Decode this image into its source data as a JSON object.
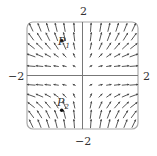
{
  "diagram": {
    "type": "vector_field",
    "field": "F(x,y) = <x, y^2> (sketch)",
    "x_range": [
      -2,
      2
    ],
    "y_range": [
      -2,
      2
    ],
    "labels": {
      "top": "2",
      "bottom": "−2",
      "left": "−2",
      "right": "2"
    },
    "points": [
      {
        "name": "P",
        "sub": "1",
        "x": -0.75,
        "y": 1.3
      },
      {
        "name": "P",
        "sub": "2",
        "x": -0.75,
        "y": -1.3
      }
    ],
    "colors": {
      "arrow": "#444444",
      "axis": "#777777",
      "frame": "#aaaaaa"
    }
  }
}
